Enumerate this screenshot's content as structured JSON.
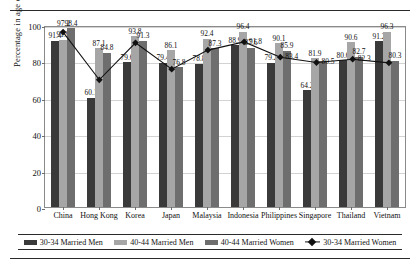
{
  "chart_data": {
    "type": "bar",
    "title": "",
    "xlabel": "",
    "ylabel": "Percentage in age cohort",
    "ylim": [
      0,
      100
    ],
    "yticks": [
      0,
      20,
      40,
      60,
      80,
      100
    ],
    "grid": true,
    "legend_position": "bottom",
    "categories": [
      "China",
      "Hong Kong",
      "Korea",
      "Japan",
      "Malaysia",
      "Indonesia",
      "Philippines",
      "Singapore",
      "Thailand",
      "Vietnam"
    ],
    "series": [
      {
        "name": "30-34 Married Men",
        "type": "bar",
        "color": "#3a3a3a",
        "values": [
          91.4,
          60.1,
          79.6,
          79.4,
          78.8,
          88.9,
          79.2,
          64.2,
          80.6,
          91.2
        ]
      },
      {
        "name": "40-44 Married Men",
        "type": "bar",
        "color": "#a6a6a6",
        "values": [
          91.9,
          87.1,
          93.8,
          86.1,
          92.4,
          96.4,
          90.1,
          81.9,
          90.6,
          96.3
        ]
      },
      {
        "name": "40-44 Married Women",
        "type": "bar",
        "color": "#6e6e6e",
        "values": [
          98.4,
          84.8,
          91.3,
          76.8,
          87.3,
          87.6,
          85.9,
          80.5,
          82.7,
          80.3
        ]
      },
      {
        "name": "30-34 Married Women",
        "type": "line",
        "color": "#111111",
        "marker": "diamond",
        "values": [
          97.2,
          71.0,
          91.3,
          76.8,
          87.3,
          91.8,
          83.4,
          80.5,
          82.3,
          80.3
        ]
      }
    ],
    "point_labels": {
      "China": [
        "91.4",
        "91.9",
        "98.4",
        "97.2"
      ],
      "Hong Kong": [
        "60.1",
        "87.1",
        "84.8",
        ""
      ],
      "Korea": [
        "79.6",
        "93.8",
        "91.3",
        ""
      ],
      "Japan": [
        "79.4",
        "86.1",
        "76.8",
        ""
      ],
      "Malaysia": [
        "78.8",
        "92.4",
        "87.3",
        ""
      ],
      "Indonesia": [
        "88.9",
        "96.4",
        "87.6",
        "91.8"
      ],
      "Philippines": [
        "79.2",
        "90.1",
        "85.9",
        "83.4"
      ],
      "Singapore": [
        "64.2",
        "81.9",
        "",
        "80.5"
      ],
      "Thailand": [
        "80.6",
        "90.6",
        "82.7",
        "82.3"
      ],
      "Vietnam": [
        "91.2",
        "96.3",
        "80.3",
        ""
      ]
    }
  },
  "legend": {
    "items": [
      {
        "label": "30-34 Married Men",
        "marker": "swatch-dark"
      },
      {
        "label": "40-44 Married Men",
        "marker": "swatch-light"
      },
      {
        "label": "40-44 Married Women",
        "marker": "swatch-mid"
      },
      {
        "label": "30-34 Married Women",
        "marker": "line-diamond"
      }
    ]
  }
}
